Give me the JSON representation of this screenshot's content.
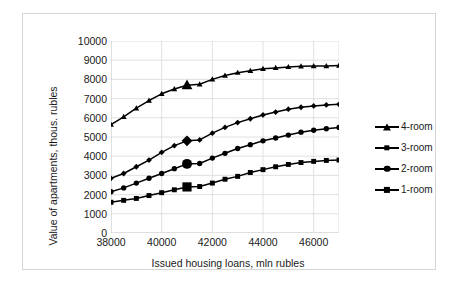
{
  "chart_data": {
    "type": "line",
    "title": "",
    "xlabel": "Issued housing loans, mln rubles",
    "ylabel": "Value of apartments, thous. rubles",
    "xlim": [
      38000,
      47000
    ],
    "ylim": [
      0,
      10000
    ],
    "grid": true,
    "legend_position": "right",
    "x_ticks": [
      38000,
      40000,
      42000,
      44000,
      46000
    ],
    "x_tick_labels": [
      "38000",
      "40000",
      "42000",
      "44000",
      "46000"
    ],
    "y_ticks": [
      0,
      1000,
      2000,
      3000,
      4000,
      5000,
      6000,
      7000,
      8000,
      9000,
      10000
    ],
    "y_tick_labels": [
      "0",
      "1000",
      "2000",
      "3000",
      "4000",
      "5000",
      "6000",
      "7000",
      "8000",
      "9000",
      "10000"
    ],
    "x": [
      38000,
      38500,
      39000,
      39500,
      40000,
      40500,
      41000,
      41500,
      42000,
      42500,
      43000,
      43500,
      44000,
      44500,
      45000,
      45500,
      46000,
      46500,
      47000
    ],
    "series": [
      {
        "name": "4-room",
        "marker": "triangle",
        "values": [
          5650,
          6050,
          6500,
          6900,
          7250,
          7500,
          7700,
          7750,
          8000,
          8200,
          8350,
          8450,
          8550,
          8600,
          8650,
          8680,
          8700,
          8700,
          8720
        ],
        "highlight_x": 41000,
        "highlight_value": 7700
      },
      {
        "name": "3-room",
        "marker": "diamond",
        "values": [
          2850,
          3100,
          3450,
          3800,
          4200,
          4550,
          4800,
          4850,
          5200,
          5500,
          5750,
          5950,
          6150,
          6300,
          6450,
          6550,
          6620,
          6670,
          6700
        ],
        "highlight_x": 41000,
        "highlight_value": 4800
      },
      {
        "name": "2-room",
        "marker": "circle",
        "values": [
          2150,
          2350,
          2600,
          2850,
          3100,
          3350,
          3600,
          3620,
          3900,
          4150,
          4400,
          4600,
          4800,
          4950,
          5100,
          5250,
          5350,
          5430,
          5500
        ],
        "highlight_x": 41000,
        "highlight_value": 3600
      },
      {
        "name": "1-room",
        "marker": "square",
        "values": [
          1600,
          1700,
          1800,
          1950,
          2100,
          2250,
          2400,
          2420,
          2600,
          2800,
          2950,
          3150,
          3300,
          3450,
          3570,
          3670,
          3730,
          3780,
          3800
        ],
        "highlight_x": 41000,
        "highlight_value": 2400
      }
    ]
  },
  "axes": {
    "y_title": "Value of apartments, thous. rubles",
    "x_title": "Issued housing loans, mln rubles"
  },
  "legend": {
    "items": [
      {
        "label": "4-room",
        "marker": "triangle"
      },
      {
        "label": "3-room",
        "marker": "diamond"
      },
      {
        "label": "2-room",
        "marker": "circle"
      },
      {
        "label": "1-room",
        "marker": "square"
      }
    ]
  },
  "colors": {
    "series": "#000000",
    "grid": "#d9d9d9",
    "axis": "#bfbfbf",
    "border": "#d6d6d6",
    "text": "#1a1a1a",
    "background": "#ffffff"
  }
}
